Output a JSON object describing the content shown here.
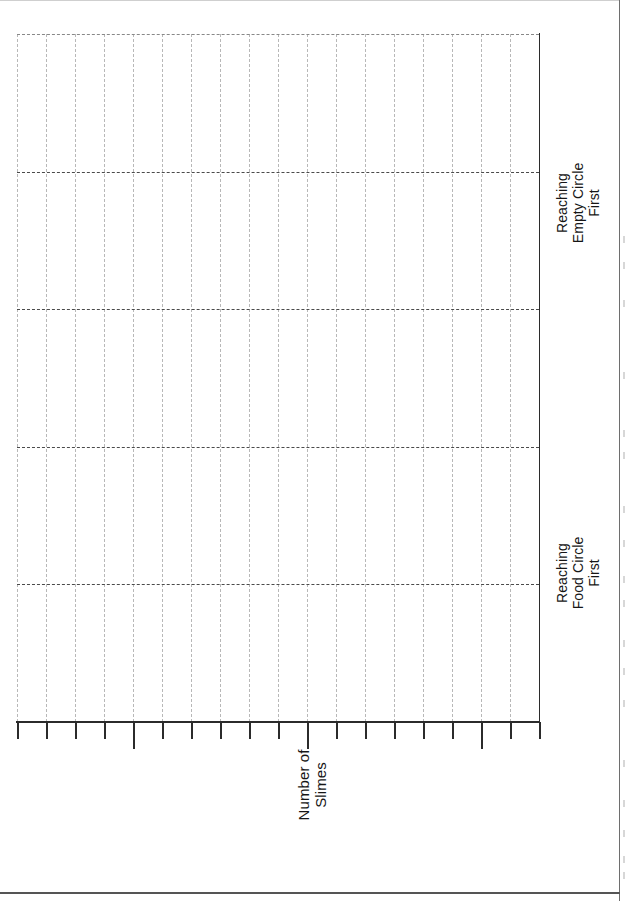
{
  "figure": {
    "orientation": "rotated-90",
    "caption": ""
  },
  "chart_data": {
    "type": "bar",
    "title": "",
    "subtitle": "",
    "orientation": "vertical-rotated",
    "categories": [
      "Reaching\nFood Circle\nFirst",
      "Reaching\nEmpty Circle\nFirst"
    ],
    "series": [
      {
        "name": "",
        "values": [
          null,
          null
        ]
      }
    ],
    "values": [
      null,
      null
    ],
    "xlabel": "",
    "ylabel": "Number of\nSlimes",
    "ylim": [
      0,
      5
    ],
    "yticks": [
      0,
      1,
      2,
      3,
      4,
      5
    ],
    "ytick_labels": [
      "",
      "",
      "",
      "",
      "",
      ""
    ],
    "grid": true,
    "grid_style": "dashed",
    "legend": false,
    "legend_position": "none",
    "note": "Blank plot template: grid and axes drawn, no bars or data points rendered",
    "n_minor_category_ticks": 18,
    "n_major_category_ticks": 3,
    "n_major_gridlines": 4,
    "n_minor_gridlines": 18
  },
  "axes": {
    "value_axis": {
      "title": "Number of\nSlimes",
      "title_line1": "Number of",
      "title_line2": "Slimes"
    },
    "category_axis": {
      "ticks": [
        {
          "id": "food-circle",
          "label": "Reaching\nFood Circle\nFirst",
          "line1": "Reaching",
          "line2": "Food Circle",
          "line3": "First"
        },
        {
          "id": "empty-circle",
          "label": "Reaching\nEmpty Circle\nFirst",
          "line1": "Reaching",
          "line2": "Empty Circle",
          "line3": "First"
        }
      ]
    }
  },
  "colors": {
    "background": "#ffffff",
    "axis": "#2b2b2b",
    "grid_major": "#4a4a4a",
    "grid_minor": "#9a9a9a",
    "text": "#161616"
  }
}
